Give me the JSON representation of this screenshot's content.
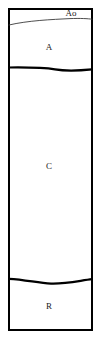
{
  "diagram": {
    "type": "soil-profile-column",
    "title": "",
    "frame": {
      "x": 8,
      "y": 8,
      "width": 85,
      "height": 323,
      "border_color": "#000000",
      "border_width": 2,
      "fill_color": "#ffffff"
    },
    "horizons": [
      {
        "id": "ao",
        "label": "Ao",
        "label_x": 71,
        "label_y": 14,
        "top_y": 10,
        "bottom_y": 22,
        "boundary_style": "thin-wavy"
      },
      {
        "id": "a",
        "label": "A",
        "label_x": 49,
        "label_y": 48,
        "top_y": 22,
        "bottom_y": 68,
        "boundary_style": "thick-wavy"
      },
      {
        "id": "c",
        "label": "C",
        "label_x": 49,
        "label_y": 167,
        "top_y": 68,
        "bottom_y": 280,
        "boundary_style": "thick-wavy"
      },
      {
        "id": "r",
        "label": "R",
        "label_x": 49,
        "label_y": 307,
        "top_y": 280,
        "bottom_y": 331,
        "boundary_style": "none"
      }
    ],
    "boundaries": [
      {
        "id": "ao-a-boundary",
        "name": "thin-wavy-boundary",
        "path": "M 9 25 C 28 20.5, 52 19.5, 70 18.6 C 80 18.2, 88 18.6, 92 19.2",
        "stroke": "#3a3a3a",
        "stroke_width": 0.9
      },
      {
        "id": "a-c-boundary",
        "name": "thick-wavy-boundary-upper",
        "path": "M 9 67.5 C 26 67.3, 42 67.2, 55 69.4 C 65 71.1, 78 70.8, 92 69.4",
        "stroke": "#000000",
        "stroke_width": 2.2
      },
      {
        "id": "c-r-boundary",
        "name": "thick-wavy-boundary-lower",
        "path": "M 9 278.8 C 26 279.6, 38 283.2, 51 283.6 C 66 284.1, 80 280.6, 92 279.2",
        "stroke": "#000000",
        "stroke_width": 2.2
      }
    ],
    "colors": {
      "line": "#000000",
      "thin_line": "#3a3a3a",
      "background": "#ffffff",
      "text": "#1a1a1a"
    }
  }
}
